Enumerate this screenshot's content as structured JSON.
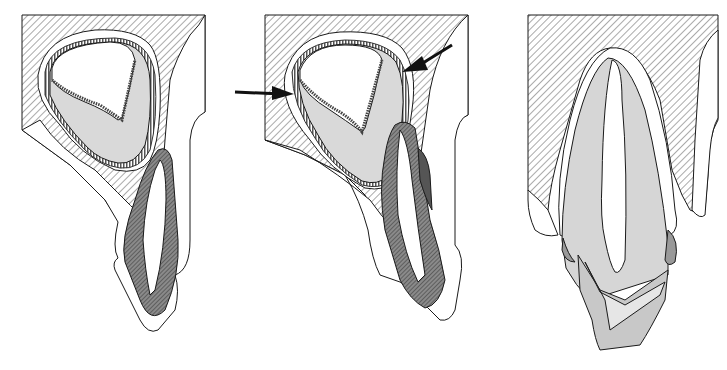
{
  "figure": {
    "panel_count": 3,
    "panels": [
      {
        "id": "panel-1",
        "description": "Permanent tooth germ in crypt with overlying primary tooth",
        "arrows": 0
      },
      {
        "id": "panel-2",
        "description": "Permanent tooth germ with reduced enamel epithelium indicated by arrows, primary tooth root resorbing",
        "arrows": 2
      },
      {
        "id": "panel-3",
        "description": "Erupting permanent tooth replacing exfoliating primary tooth crown remnant"
      }
    ],
    "colors": {
      "background": "#ffffff",
      "outline": "#1a1a1a",
      "bone_hatch": "#555555",
      "dentin_gray": "#d6d6d6",
      "primary_tooth_dark": "#6a6a6a",
      "primary_tooth_darkest": "#444444",
      "arrow": "#111111",
      "epithelium_stipple": "#444444",
      "crown_light": "#e6e6e6",
      "crown_mid": "#c8c8c8"
    },
    "legend": []
  }
}
